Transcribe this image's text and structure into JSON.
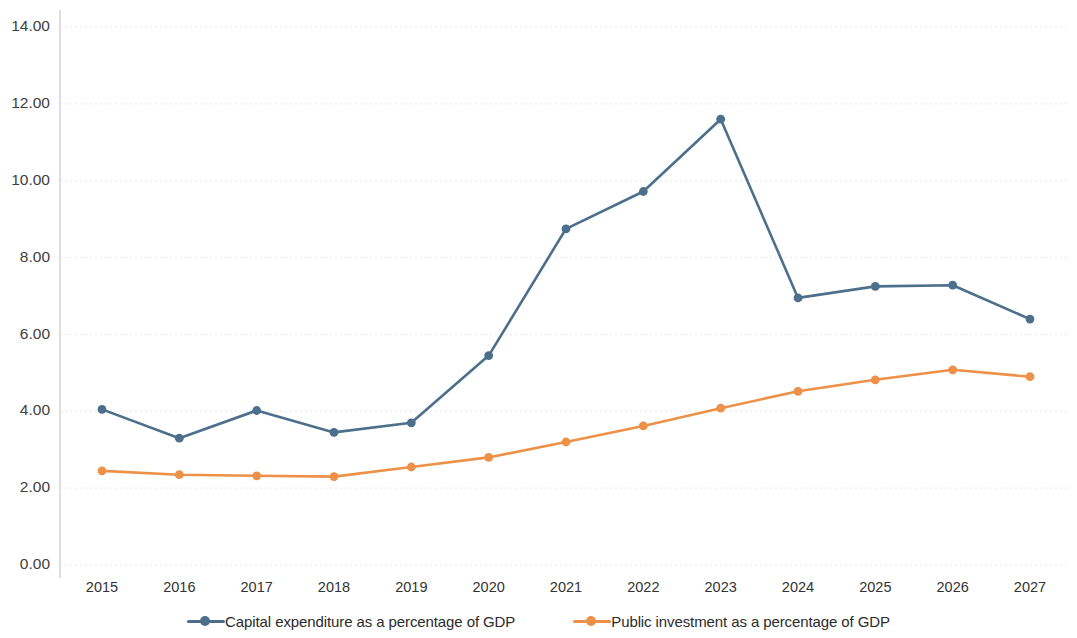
{
  "chart_data": {
    "type": "line",
    "title": "",
    "subtitle": "",
    "xlabel": "",
    "ylabel": "",
    "categories": [
      "2015",
      "2016",
      "2017",
      "2018",
      "2019",
      "2020",
      "2021",
      "2022",
      "2023",
      "2024",
      "2025",
      "2026",
      "2027"
    ],
    "ylim": [
      0.0,
      14.0
    ],
    "ytick_labels": [
      "14.00",
      "12.00",
      "10.00",
      "8.00",
      "6.00",
      "4.00",
      "2.00",
      "0.00"
    ],
    "ytick_values": [
      14.0,
      12.0,
      10.0,
      8.0,
      6.0,
      4.0,
      2.0,
      0.0
    ],
    "grid": true,
    "legend_position": "bottom",
    "series": [
      {
        "name": "Capital expenditure as a percentage of GDP",
        "color": "#4c6f8c",
        "values": [
          4.05,
          3.3,
          4.02,
          3.45,
          3.7,
          5.45,
          8.75,
          9.72,
          11.6,
          6.95,
          7.25,
          7.28,
          6.4
        ]
      },
      {
        "name": "Public investment as a percentage of GDP",
        "color": "#ed9148",
        "values": [
          2.45,
          2.35,
          2.32,
          2.3,
          2.55,
          2.8,
          3.2,
          3.62,
          4.08,
          4.52,
          4.82,
          5.08,
          4.9
        ]
      }
    ]
  },
  "legend": {
    "items": [
      {
        "label": "Capital expenditure as a percentage of GDP",
        "color": "#4c6f8c"
      },
      {
        "label": "Public investment as a percentage of GDP",
        "color": "#ed9148"
      }
    ]
  }
}
